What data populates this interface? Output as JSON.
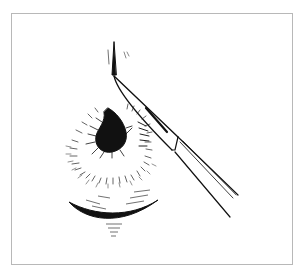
{
  "illustration": {
    "subject": "scalpel-incision-on-eyelid-lesion",
    "colors": {
      "ink": "#111111",
      "frame": "#b8b8b8",
      "background": "#ffffff"
    },
    "elements": [
      "scalpel",
      "pigmented-lesion",
      "hatched-surround",
      "lower-lid-shadow"
    ]
  }
}
